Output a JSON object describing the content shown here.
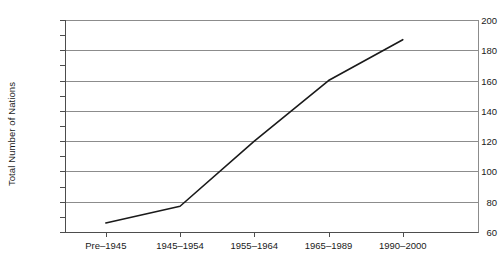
{
  "chart_data": {
    "type": "line",
    "title": "",
    "xlabel": "",
    "ylabel": "Total Number of Nations",
    "categories": [
      "Pre–1945",
      "1945–1954",
      "1955–1964",
      "1965–1989",
      "1990–2000"
    ],
    "values": [
      66,
      77,
      120,
      160,
      187
    ],
    "series": [
      {
        "name": "Total Number of Nations",
        "values": [
          66,
          77,
          120,
          160,
          187
        ]
      }
    ],
    "ylim": [
      60,
      200
    ],
    "y_major_ticks": [
      60,
      80,
      100,
      120,
      140,
      160,
      180,
      200
    ],
    "y_minor_ticks": [
      70,
      90,
      110,
      130,
      150,
      170,
      190
    ],
    "y_tick_labels": [
      "60",
      "80",
      "100",
      "120",
      "140",
      "160",
      "180",
      "200"
    ],
    "grid": "horizontal",
    "legend": "none",
    "line_color": "#1a1a1a",
    "grid_color": "#8c8c8c",
    "axis_color": "#4d4d4d",
    "background_color": "#ffffff"
  }
}
